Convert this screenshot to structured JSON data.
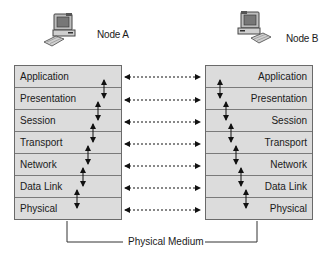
{
  "nodes": {
    "a": {
      "label": "Node A",
      "icon": "desktop-computer-icon"
    },
    "b": {
      "label": "Node B",
      "icon": "desktop-computer-icon"
    }
  },
  "layers": [
    {
      "name": "Application"
    },
    {
      "name": "Presentation"
    },
    {
      "name": "Session"
    },
    {
      "name": "Transport"
    },
    {
      "name": "Network"
    },
    {
      "name": "Data Link"
    },
    {
      "name": "Physical"
    }
  ],
  "stack_a": {
    "rows": [
      "Application",
      "Presentation",
      "Session",
      "Transport",
      "Network",
      "Data Link",
      "Physical"
    ]
  },
  "stack_b": {
    "rows": [
      "Application",
      "Presentation",
      "Session",
      "Transport",
      "Network",
      "Data Link",
      "Physical"
    ]
  },
  "medium": {
    "label": "Physical Medium"
  },
  "colors": {
    "layer_fill": "#dcdcdc",
    "border": "#6a6a6a",
    "arrow": "#111111"
  }
}
